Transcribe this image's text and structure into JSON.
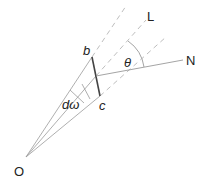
{
  "diagram": {
    "labels": {
      "origin": "O",
      "b": "b",
      "c": "c",
      "d_omega": "dω",
      "theta": "θ",
      "L": "L",
      "N": "N"
    },
    "colors": {
      "solid_line": "#9a9a9a",
      "dark_line": "#444444",
      "dashed_line": "#b5b5b5",
      "text": "#222222"
    }
  }
}
